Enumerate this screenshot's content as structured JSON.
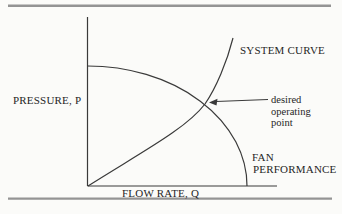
{
  "figure": {
    "type": "fan-system-curve-diagram",
    "colors": {
      "background": "#fbfbf9",
      "rule": "#949494",
      "line": "#3a3a3a",
      "text": "#262626"
    },
    "y_axis_label": "PRESSURE, P",
    "x_axis_label": "FLOW RATE, Q",
    "system_curve": {
      "label": "SYSTEM CURVE",
      "path": "M 88 186 C 140 153 186 129 205 104 C 216 88 227 62 233 38"
    },
    "fan_curve": {
      "label_line1": "FAN",
      "label_line2": "PERFORMANCE",
      "path": "M 87.5 66 A 159.5 120 0 0 1 247 186"
    },
    "annotation": {
      "line1": "desired",
      "line2": "operating",
      "line3": "point"
    }
  }
}
